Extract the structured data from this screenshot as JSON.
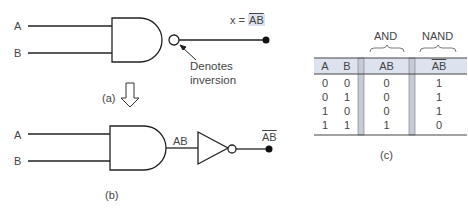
{
  "figure_a": {
    "input_a": "A",
    "input_b": "B",
    "output_label": "x = ",
    "output_expr": "AB",
    "annotation_line1": "Denotes",
    "annotation_line2": "inversion",
    "caption": "(a)"
  },
  "figure_b": {
    "input_a": "A",
    "input_b": "B",
    "and_output": "AB",
    "final_output": "AB",
    "caption": "(b)"
  },
  "figure_c": {
    "caption": "(c)",
    "group_headers": [
      "AND",
      "NAND"
    ],
    "columns": [
      "A",
      "B",
      "AB",
      "AB"
    ],
    "rows": [
      [
        "0",
        "0",
        "0",
        "1"
      ],
      [
        "0",
        "1",
        "0",
        "1"
      ],
      [
        "1",
        "0",
        "0",
        "1"
      ],
      [
        "1",
        "1",
        "1",
        "0"
      ]
    ],
    "header_bg": "#dde3ee",
    "separator_bg": "#c5ccd8"
  }
}
